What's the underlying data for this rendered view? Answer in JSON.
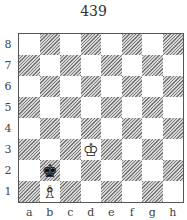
{
  "title": "439",
  "board": {
    "files": [
      "a",
      "b",
      "c",
      "d",
      "e",
      "f",
      "g",
      "h"
    ],
    "ranks": [
      "8",
      "7",
      "6",
      "5",
      "4",
      "3",
      "2",
      "1"
    ],
    "light_color": "#ffffff",
    "dark_style": "hatched",
    "pieces": [
      {
        "square": "d3",
        "piece": "white-king",
        "glyph": "♔"
      },
      {
        "square": "b2",
        "piece": "black-king",
        "glyph": "♚"
      },
      {
        "square": "b1",
        "piece": "white-bishop",
        "glyph": "♗"
      }
    ]
  }
}
